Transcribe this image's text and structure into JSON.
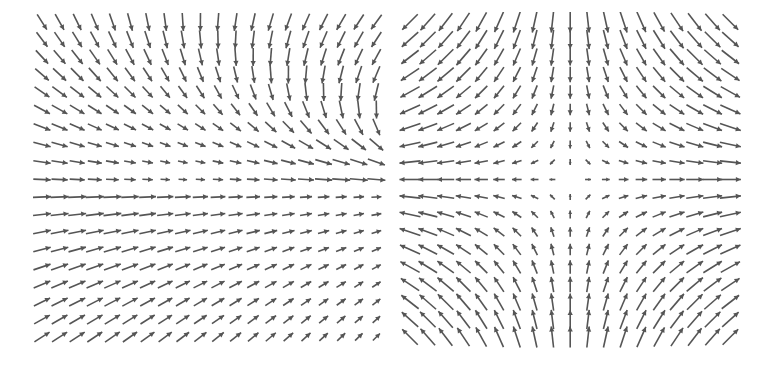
{
  "chart_data": [
    {
      "type": "quiver",
      "title": "",
      "description": "Vector field with uniform rightward flow at bottom and downward converging flow at top, meeting near a point left of center",
      "grid": {
        "cols": 20,
        "rows": 19
      },
      "x_range": [
        -1,
        1
      ],
      "y_range": [
        -1,
        1
      ],
      "arrow_color": "#555555",
      "axes_visible": false
    },
    {
      "type": "quiver",
      "title": "",
      "description": "Saddle point vector field F(x,y) = (x, -y): inflow along vertical axis, outflow along horizontal axis",
      "grid": {
        "cols": 19,
        "rows": 19
      },
      "x_range": [
        -1,
        1
      ],
      "y_range": [
        -1,
        1
      ],
      "arrow_color": "#555555",
      "axes_visible": false
    }
  ],
  "colors": {
    "arrow": "#555555",
    "background": "#ffffff"
  }
}
